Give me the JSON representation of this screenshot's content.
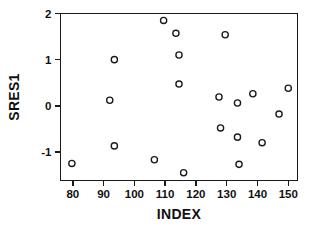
{
  "chart_data": {
    "type": "scatter",
    "title": "",
    "xlabel": "INDEX",
    "ylabel": "SRES1",
    "xlim": [
      76,
      153
    ],
    "ylim": [
      -1.62,
      2.0
    ],
    "grid": false,
    "legend": null,
    "x_ticks": [
      80,
      90,
      100,
      110,
      120,
      130,
      140,
      150
    ],
    "y_ticks": [
      2,
      1,
      0,
      -1
    ],
    "x_tick_labels": [
      "80",
      "90",
      "100",
      "110",
      "120",
      "130",
      "140",
      "150"
    ],
    "y_tick_labels": [
      "2",
      "1",
      "0",
      "-1"
    ],
    "marker": "open-circle",
    "marker_color": "#1a1a1a",
    "n_points": 20,
    "points": [
      {
        "x": 79.7,
        "y": -1.25
      },
      {
        "x": 92.0,
        "y": 0.12
      },
      {
        "x": 93.5,
        "y": 1.0
      },
      {
        "x": 93.5,
        "y": -0.87
      },
      {
        "x": 106.5,
        "y": -1.17
      },
      {
        "x": 109.5,
        "y": 1.85
      },
      {
        "x": 113.5,
        "y": 1.57
      },
      {
        "x": 114.5,
        "y": 1.1
      },
      {
        "x": 114.5,
        "y": 0.47
      },
      {
        "x": 116.0,
        "y": -1.45
      },
      {
        "x": 127.5,
        "y": 0.19
      },
      {
        "x": 128.0,
        "y": -0.48
      },
      {
        "x": 129.5,
        "y": 1.54
      },
      {
        "x": 133.5,
        "y": 0.06
      },
      {
        "x": 133.5,
        "y": -0.68
      },
      {
        "x": 134.0,
        "y": -1.27
      },
      {
        "x": 138.5,
        "y": 0.26
      },
      {
        "x": 141.5,
        "y": -0.8
      },
      {
        "x": 147.0,
        "y": -0.18
      },
      {
        "x": 150.0,
        "y": 0.38
      }
    ]
  }
}
